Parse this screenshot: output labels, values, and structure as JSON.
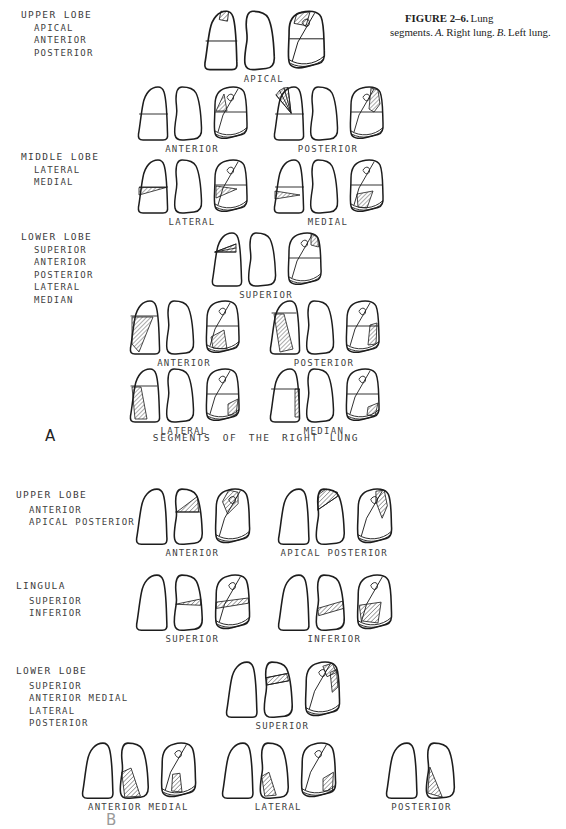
{
  "caption": {
    "figure_label": "FIGURE 2–6.",
    "title": "Lung segments.",
    "a_marker": "A.",
    "a_text": "Right lung.",
    "b_marker": "B.",
    "b_text": "Left lung."
  },
  "section_a": {
    "marker": "A",
    "caption": "SEGMENTS OF THE RIGHT LUNG",
    "lobes": [
      {
        "name": "UPPER LOBE",
        "segments": [
          "APICAL",
          "ANTERIOR",
          "POSTERIOR"
        ]
      },
      {
        "name": "MIDDLE LOBE",
        "segments": [
          "LATERAL",
          "MEDIAL"
        ]
      },
      {
        "name": "LOWER LOBE",
        "segments": [
          "SUPERIOR",
          "ANTERIOR",
          "POSTERIOR",
          "LATERAL",
          "MEDIAN"
        ]
      }
    ],
    "groups": [
      {
        "id": "a-apical",
        "label": "APICAL"
      },
      {
        "id": "a-anterior-upper",
        "label": "ANTERIOR"
      },
      {
        "id": "a-posterior-upper",
        "label": "POSTERIOR"
      },
      {
        "id": "a-lateral-middle",
        "label": "LATERAL"
      },
      {
        "id": "a-medial-middle",
        "label": "MEDIAL"
      },
      {
        "id": "a-superior-lower",
        "label": "SUPERIOR"
      },
      {
        "id": "a-anterior-lower",
        "label": "ANTERIOR"
      },
      {
        "id": "a-posterior-lower",
        "label": "POSTERIOR"
      },
      {
        "id": "a-lateral-lower",
        "label": "LATERAL"
      },
      {
        "id": "a-median-lower",
        "label": "MEDIAN"
      }
    ]
  },
  "section_b": {
    "marker": "B",
    "lobes": [
      {
        "name": "UPPER LOBE",
        "segments": [
          "ANTERIOR",
          "APICAL POSTERIOR"
        ]
      },
      {
        "name": "LINGULA",
        "segments": [
          "SUPERIOR",
          "INFERIOR"
        ]
      },
      {
        "name": "LOWER LOBE",
        "segments": [
          "SUPERIOR",
          "ANTERIOR MEDIAL",
          "LATERAL",
          "POSTERIOR"
        ]
      }
    ],
    "groups": [
      {
        "id": "b-anterior-upper",
        "label": "ANTERIOR"
      },
      {
        "id": "b-apical-posterior",
        "label": "APICAL POSTERIOR"
      },
      {
        "id": "b-superior-lingula",
        "label": "SUPERIOR"
      },
      {
        "id": "b-inferior-lingula",
        "label": "INFERIOR"
      },
      {
        "id": "b-superior-lower",
        "label": "SUPERIOR"
      },
      {
        "id": "b-anterior-medial-lower",
        "label": "ANTERIOR MEDIAL"
      },
      {
        "id": "b-lateral-lower",
        "label": "LATERAL"
      },
      {
        "id": "b-posterior-lower",
        "label": "POSTERIOR"
      }
    ]
  },
  "colors": {
    "ink": "#1d1d1d",
    "label_text": "#3f3f3f"
  }
}
